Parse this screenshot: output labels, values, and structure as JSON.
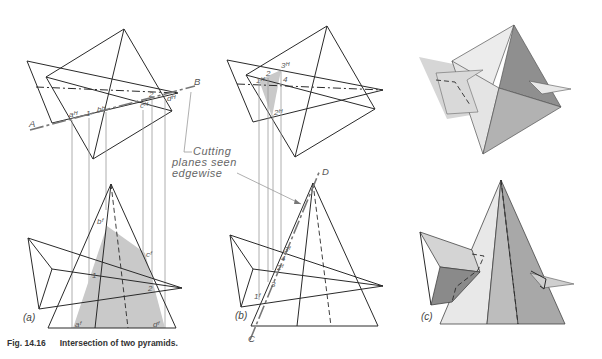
{
  "figure": {
    "caption_number": "Fig. 14.16",
    "caption_text": "Intersection of two pyramids.",
    "annotation_lines": [
      "Cutting",
      "planes seen",
      "edgewise"
    ],
    "colors": {
      "line": "#2a2a2a",
      "projector": "#9a9a9a",
      "shade_light": "#e6e6e6",
      "shade_mid": "#c9c9c9",
      "shade_dark": "#9e9e9e"
    }
  },
  "panels": {
    "a": {
      "label": "(a)",
      "cutting_line_start": "A",
      "cutting_line_end": "B",
      "top_view_points": [
        "aᴴ",
        "1",
        "bᴴ",
        "cᴴ",
        "2",
        "dᴴ"
      ],
      "front_view_points": [
        "bᶠ",
        "cᶠ",
        "1",
        "2",
        "aᶠ",
        "dᶠ"
      ]
    },
    "b": {
      "label": "(b)",
      "cutting_line_start": "C",
      "cutting_line_end": "D",
      "top_view_points": [
        "1ᴴ",
        "2",
        "3ᴴ",
        "4",
        "2ᴴ"
      ],
      "front_view_points": [
        "3ᶠ",
        "4",
        "2ᶠ",
        "3",
        "1ᶠ"
      ]
    },
    "c": {
      "label": "(c)"
    }
  }
}
